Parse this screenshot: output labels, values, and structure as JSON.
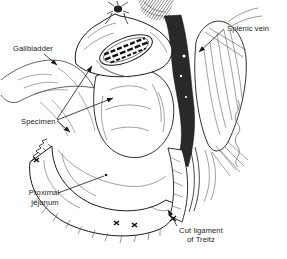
{
  "illustration": {
    "background_color": "#ffffff",
    "ink_color": "#1a1a1a",
    "labels": {
      "gallbladder": "Gallbladder",
      "specimen": "Specimen",
      "proximal_jejunum": {
        "line1": "Proximal",
        "line2": "jejunum"
      },
      "splenic_vein": "Splenic vein",
      "cut_ligament_of_treitz": {
        "line1": "Cut ligament",
        "line2": "of Treitz"
      }
    }
  }
}
